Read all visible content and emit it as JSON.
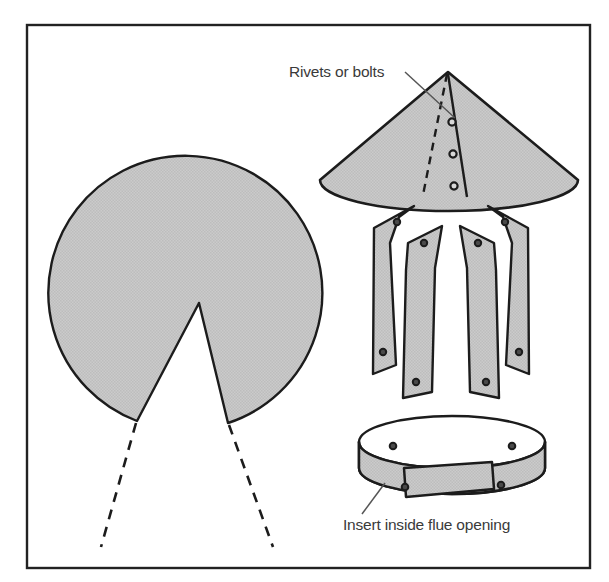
{
  "figure": {
    "background_color": "#ffffff",
    "ink_color": "#1c1c1c",
    "metal_fill_color": "#c8c8c8",
    "frame": {
      "name": "diagram-border",
      "x": 27,
      "y": 25,
      "width": 563,
      "height": 543,
      "stroke_color": "#222222",
      "stroke_width": 2.4
    }
  },
  "labels": [
    {
      "id": "rivets-or-bolts",
      "text": "Rivets or bolts",
      "x": 289,
      "y": 77,
      "anchor": "start",
      "leader": {
        "x1": 405,
        "y1": 72,
        "x2": 455,
        "y2": 118
      }
    },
    {
      "id": "insert-inside-flue-opening",
      "text": "Insert inside flue opening",
      "x": 343,
      "y": 530,
      "anchor": "start",
      "leader": {
        "x1": 362,
        "y1": 514,
        "x2": 385,
        "y2": 483
      }
    }
  ],
  "parts": {
    "cone_pattern": {
      "name": "flat-cone-pattern",
      "description": "Circular sheet metal blank with pie wedge removed",
      "center_x": 196,
      "center_y": 297,
      "radius": 137,
      "notch_apex_x": 199,
      "notch_apex_y": 303,
      "notch_left_x": 137,
      "notch_left_y": 421,
      "notch_right_x": 228,
      "notch_right_y": 423,
      "dashed_extensions": [
        {
          "x1": 136,
          "y1": 423,
          "x2": 101,
          "y2": 547
        },
        {
          "x1": 229,
          "y1": 425,
          "x2": 273,
          "y2": 547
        }
      ]
    },
    "assembled_cone": {
      "name": "assembled-cone-cap",
      "apex_x": 448,
      "apex_y": 72,
      "base_center_x": 449,
      "base_center_y": 178,
      "base_rx": 129,
      "base_ry": 31,
      "seam_solid": {
        "x1": 448,
        "y1": 74,
        "x2": 467,
        "y2": 196
      },
      "seam_dashed": {
        "x1": 447,
        "y1": 74,
        "x2": 424,
        "y2": 194
      },
      "rivets": [
        {
          "cx": 452,
          "cy": 122,
          "r": 3.4
        },
        {
          "cx": 453,
          "cy": 154,
          "r": 3.4
        },
        {
          "cx": 454,
          "cy": 186,
          "r": 3.4
        }
      ]
    },
    "straps": {
      "name": "mounting-straps",
      "count": 4,
      "items": [
        {
          "id": "strap-outer-left",
          "rivets": [
            {
              "cx": 396,
              "cy": 222
            },
            {
              "cx": 385,
              "cy": 352
            }
          ]
        },
        {
          "id": "strap-inner-left",
          "rivets": [
            {
              "cx": 424,
              "cy": 243
            },
            {
              "cx": 412,
              "cy": 382
            }
          ]
        },
        {
          "id": "strap-inner-right",
          "rivets": [
            {
              "cx": 478,
              "cy": 243
            },
            {
              "cx": 490,
              "cy": 382
            }
          ]
        },
        {
          "id": "strap-outer-right",
          "rivets": [
            {
              "cx": 505,
              "cy": 222
            },
            {
              "cx": 516,
              "cy": 352
            }
          ]
        }
      ]
    },
    "collar_band": {
      "name": "flue-collar-band",
      "description": "Cylindrical band with overlapping ends, inserted inside flue",
      "top_center_x": 452,
      "top_center_y": 442,
      "rx": 93,
      "ry": 26,
      "band_height": 46,
      "rivets": [
        {
          "cx": 393,
          "cy": 446
        },
        {
          "cx": 512,
          "cy": 446
        },
        {
          "cx": 405,
          "cy": 487
        },
        {
          "cx": 501,
          "cy": 485
        }
      ]
    }
  }
}
